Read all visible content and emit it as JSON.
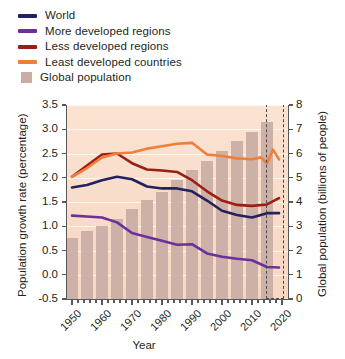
{
  "chart_data": {
    "type": "line",
    "title": "",
    "xlabel": "Year",
    "ylabel": "Population growth rate (percentage)",
    "y2label": "Global population (billions of people)",
    "xlim": [
      1948,
      2022
    ],
    "ylim": [
      -0.5,
      3.5
    ],
    "y2lim": [
      0,
      8
    ],
    "grid": true,
    "legend_position": "above-plot",
    "xticks": [
      "1950",
      "1960",
      "1970",
      "1980",
      "1990",
      "2000",
      "2010",
      "2020"
    ],
    "xtick_values": [
      1950,
      1960,
      1970,
      1980,
      1990,
      2000,
      2010,
      2020
    ],
    "yticks": [
      "-0.5",
      "0.0",
      "0.5",
      "1.0",
      "1.5",
      "2.0",
      "2.5",
      "3.0",
      "3.5"
    ],
    "ytick_values": [
      -0.5,
      0.0,
      0.5,
      1.0,
      1.5,
      2.0,
      2.5,
      3.0,
      3.5
    ],
    "y2ticks": [
      "0",
      "1",
      "2",
      "3",
      "4",
      "5",
      "6",
      "7",
      "8"
    ],
    "y2tick_values": [
      0,
      1,
      2,
      3,
      4,
      5,
      6,
      7,
      8
    ],
    "annotations": [
      {
        "name": "projection-box",
        "x_start": 2014.5,
        "x_end": 2020.5,
        "label": ""
      }
    ],
    "bars": {
      "name": "Global population",
      "color": "#c9ada4",
      "axis": "right",
      "x": [
        1950,
        1955,
        1960,
        1965,
        1970,
        1975,
        1980,
        1985,
        1990,
        1995,
        2000,
        2005,
        2010,
        2015
      ],
      "values": [
        2.5,
        2.8,
        3.0,
        3.3,
        3.7,
        4.1,
        4.4,
        4.9,
        5.3,
        5.7,
        6.1,
        6.5,
        6.9,
        7.3
      ]
    },
    "series": [
      {
        "name": "World",
        "color": "#232160",
        "axis": "left",
        "x": [
          1950,
          1955,
          1960,
          1965,
          1970,
          1975,
          1980,
          1985,
          1990,
          1995,
          2000,
          2005,
          2010,
          2015,
          2019
        ],
        "values": [
          1.8,
          1.85,
          1.95,
          2.02,
          1.97,
          1.82,
          1.78,
          1.78,
          1.72,
          1.53,
          1.32,
          1.23,
          1.18,
          1.27,
          1.27
        ]
      },
      {
        "name": "More developed regions",
        "color": "#6b2f9e",
        "axis": "left",
        "x": [
          1950,
          1955,
          1960,
          1965,
          1970,
          1975,
          1980,
          1985,
          1990,
          1995,
          2000,
          2005,
          2010,
          2015,
          2019
        ],
        "values": [
          1.22,
          1.2,
          1.18,
          1.08,
          0.86,
          0.78,
          0.7,
          0.62,
          0.63,
          0.44,
          0.37,
          0.33,
          0.3,
          0.16,
          0.15
        ]
      },
      {
        "name": "Less developed regions",
        "color": "#9c1e12",
        "axis": "left",
        "x": [
          1950,
          1955,
          1960,
          1965,
          1970,
          1975,
          1980,
          1985,
          1990,
          1995,
          2000,
          2005,
          2010,
          2015,
          2019
        ],
        "values": [
          2.02,
          2.25,
          2.48,
          2.5,
          2.3,
          2.17,
          2.15,
          2.12,
          1.95,
          1.72,
          1.53,
          1.44,
          1.42,
          1.45,
          1.58
        ]
      },
      {
        "name": "Least developed countries",
        "color": "#ee7f3b",
        "axis": "left",
        "x": [
          1950,
          1955,
          1960,
          1965,
          1970,
          1975,
          1980,
          1985,
          1990,
          1995,
          2000,
          2005,
          2010,
          2013,
          2015,
          2017,
          2019
        ],
        "values": [
          2.02,
          2.2,
          2.42,
          2.5,
          2.52,
          2.6,
          2.65,
          2.7,
          2.72,
          2.48,
          2.45,
          2.4,
          2.38,
          2.42,
          2.3,
          2.58,
          2.38
        ]
      }
    ]
  },
  "legend": {
    "items": [
      {
        "label": "World",
        "color": "#232160",
        "marker": "line"
      },
      {
        "label": "More developed regions",
        "color": "#6b2f9e",
        "marker": "line"
      },
      {
        "label": "Less developed regions",
        "color": "#9c1e12",
        "marker": "line"
      },
      {
        "label": "Least developed countries",
        "color": "#ee7f3b",
        "marker": "line"
      },
      {
        "label": "Global population",
        "color": "#c9ada4",
        "marker": "box"
      }
    ]
  }
}
